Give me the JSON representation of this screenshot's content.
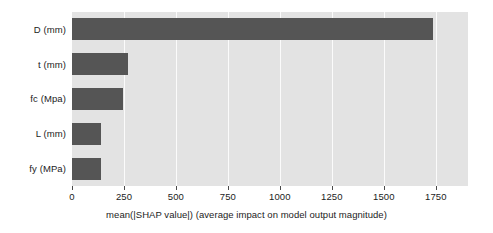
{
  "chart_data": {
    "type": "bar",
    "orientation": "horizontal",
    "title": "",
    "xlabel": "mean(|SHAP value|) (average impact on model output magnitude)",
    "ylabel": "",
    "categories": [
      "D (mm)",
      "t (mm)",
      "fc (Mpa)",
      "L (mm)",
      "fy (MPa)"
    ],
    "values": [
      1735,
      268,
      245,
      141,
      140
    ],
    "xlim": [
      0,
      1905
    ],
    "xticks": [
      0,
      250,
      500,
      750,
      1000,
      1250,
      1500,
      1750
    ],
    "xtick_labels": [
      "0",
      "250",
      "500",
      "750",
      "1000",
      "1250",
      "1500",
      "1750"
    ],
    "grid": "vertical-only",
    "legend": "none",
    "bar_color": "#555555",
    "plot_background": "#e3e3e3",
    "gridline_color": "#fbfbfb",
    "text_color": "#1c1c1c"
  }
}
